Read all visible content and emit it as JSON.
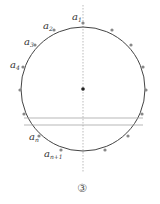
{
  "figure": {
    "caption": "③",
    "labels": {
      "a1": {
        "base": "a",
        "sub": "1"
      },
      "a2": {
        "base": "a",
        "sub": "2"
      },
      "a3": {
        "base": "a",
        "sub": "3"
      },
      "a4": {
        "base": "a",
        "sub": "4"
      },
      "an": {
        "base": "a",
        "sub": "n"
      },
      "an1": {
        "base": "a",
        "sub": "n+1"
      }
    },
    "colors": {
      "circle": "#444444",
      "points": "#888888",
      "lines": "#aaaaaa",
      "center": "#222222"
    }
  }
}
